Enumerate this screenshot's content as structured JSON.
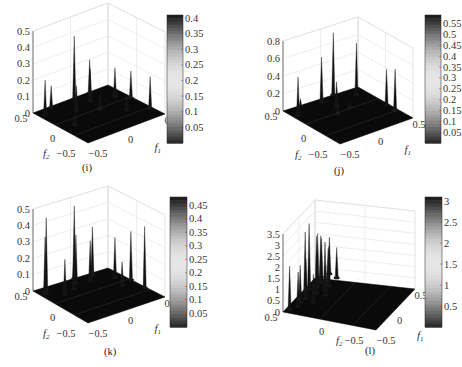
{
  "figure": {
    "panels": [
      "i",
      "j",
      "k",
      "l"
    ]
  },
  "chart_data": [
    {
      "id": "i",
      "type": "surface3d",
      "caption": "(i)",
      "xlabel": "f1",
      "ylabel": "f2",
      "x_ticks": [
        "-0.5",
        "0",
        "0.5"
      ],
      "y_ticks": [
        "-0.5",
        "0",
        "0.5"
      ],
      "z_ticks": [
        "0",
        "0.1",
        "0.2",
        "0.3",
        "0.4",
        "0.5"
      ],
      "zlim": [
        0,
        0.5
      ],
      "colorbar": {
        "ticks": [
          "0.05",
          "0.1",
          "0.15",
          "0.2",
          "0.25",
          "0.3",
          "0.35",
          "0.4"
        ],
        "range": [
          0,
          0.41
        ],
        "colormap": "gray-symmetric"
      },
      "grid": true,
      "peaks": [
        {
          "f1": -0.45,
          "f2": 0.35,
          "z": 0.22
        },
        {
          "f1": -0.3,
          "f2": 0.45,
          "z": 0.14
        },
        {
          "f1": -0.15,
          "f2": 0.2,
          "z": 0.16
        },
        {
          "f1": 0.0,
          "f2": 0.45,
          "z": 0.39
        },
        {
          "f1": 0.1,
          "f2": 0.3,
          "z": 0.2
        },
        {
          "f1": 0.2,
          "f2": 0.45,
          "z": 0.21
        },
        {
          "f1": 0.35,
          "f2": 0.2,
          "z": 0.18
        },
        {
          "f1": 0.45,
          "f2": 0.05,
          "z": 0.17
        },
        {
          "f1": 0.45,
          "f2": -0.3,
          "z": 0.2
        },
        {
          "f1": 0.05,
          "f2": 0.05,
          "z": 0.1
        },
        {
          "f1": -0.35,
          "f2": -0.05,
          "z": 0.07
        },
        {
          "f1": 0.25,
          "f2": -0.15,
          "z": 0.1
        }
      ]
    },
    {
      "id": "j",
      "type": "surface3d",
      "caption": "(j)",
      "xlabel": "f1",
      "ylabel": "f2",
      "x_ticks": [
        "-0.5",
        "0",
        "0.5"
      ],
      "y_ticks": [
        "-0.5",
        "0",
        "0.5"
      ],
      "z_ticks": [
        "0",
        "0.2",
        "0.4",
        "0.6",
        "0.8"
      ],
      "zlim": [
        0,
        0.8
      ],
      "colorbar": {
        "ticks": [
          "0.05",
          "0.1",
          "0.15",
          "0.2",
          "0.25",
          "0.3",
          "0.35",
          "0.4",
          "0.45",
          "0.5",
          "0.55"
        ],
        "range": [
          0,
          0.59
        ],
        "colormap": "gray-symmetric"
      },
      "grid": true,
      "peaks": [
        {
          "f1": -0.45,
          "f2": 0.3,
          "z": 0.45
        },
        {
          "f1": -0.3,
          "f2": 0.45,
          "z": 0.1
        },
        {
          "f1": -0.05,
          "f2": 0.4,
          "z": 0.52
        },
        {
          "f1": 0.0,
          "f2": 0.2,
          "z": 0.3
        },
        {
          "f1": 0.15,
          "f2": 0.45,
          "z": 0.72
        },
        {
          "f1": 0.35,
          "f2": 0.3,
          "z": 0.6
        },
        {
          "f1": 0.45,
          "f2": -0.1,
          "z": 0.42
        },
        {
          "f1": 0.45,
          "f2": -0.25,
          "z": 0.48
        },
        {
          "f1": -0.1,
          "f2": 0.05,
          "z": 0.12
        },
        {
          "f1": 0.1,
          "f2": 0.1,
          "z": 0.08
        }
      ]
    },
    {
      "id": "k",
      "type": "surface3d",
      "caption": "(k)",
      "xlabel": "f1",
      "ylabel": "f2",
      "x_ticks": [
        "-0.5",
        "0",
        "0.5"
      ],
      "y_ticks": [
        "-0.5",
        "0",
        "0.5"
      ],
      "z_ticks": [
        "0",
        "0.1",
        "0.2",
        "0.3",
        "0.4",
        "0.5"
      ],
      "zlim": [
        0,
        0.5
      ],
      "colorbar": {
        "ticks": [
          "0.05",
          "0.1",
          "0.15",
          "0.2",
          "0.25",
          "0.3",
          "0.35",
          "0.4",
          "0.45"
        ],
        "range": [
          0,
          0.48
        ],
        "colormap": "gray-symmetric"
      },
      "grid": true,
      "peaks": [
        {
          "f1": -0.45,
          "f2": 0.35,
          "z": 0.35
        },
        {
          "f1": -0.4,
          "f2": 0.4,
          "z": 0.45
        },
        {
          "f1": -0.3,
          "f2": 0.2,
          "z": 0.22
        },
        {
          "f1": -0.15,
          "f2": 0.25,
          "z": 0.2
        },
        {
          "f1": -0.05,
          "f2": 0.35,
          "z": 0.3
        },
        {
          "f1": 0.0,
          "f2": 0.45,
          "z": 0.45
        },
        {
          "f1": 0.1,
          "f2": 0.3,
          "z": 0.25
        },
        {
          "f1": 0.2,
          "f2": 0.4,
          "z": 0.3
        },
        {
          "f1": 0.35,
          "f2": 0.2,
          "z": 0.25
        },
        {
          "f1": 0.45,
          "f2": 0.05,
          "z": 0.3
        },
        {
          "f1": 0.45,
          "f2": -0.2,
          "z": 0.38
        },
        {
          "f1": 0.3,
          "f2": 0.0,
          "z": 0.15
        }
      ]
    },
    {
      "id": "l",
      "type": "surface3d",
      "caption": "(l)",
      "xlabel": "f1",
      "ylabel": "f2",
      "x_ticks": [
        "-0.5",
        "0",
        "0.5"
      ],
      "y_ticks": [
        "-0.5",
        "0",
        "0.5"
      ],
      "z_ticks": [
        "0",
        "0.5",
        "1",
        "1.5",
        "2",
        "2.5",
        "3",
        "3.5"
      ],
      "zlim": [
        0,
        3.5
      ],
      "colorbar": {
        "ticks": [
          "0.5",
          "1",
          "1.5",
          "2",
          "2.5",
          "3"
        ],
        "range": [
          0,
          3.1
        ],
        "colormap": "gray-symmetric"
      },
      "grid": true,
      "peaks": [
        {
          "f1": -0.45,
          "f2": 0.45,
          "z": 2.0
        },
        {
          "f1": -0.35,
          "f2": 0.4,
          "z": 1.6
        },
        {
          "f1": -0.25,
          "f2": 0.42,
          "z": 1.7
        },
        {
          "f1": -0.15,
          "f2": 0.4,
          "z": 1.8
        },
        {
          "f1": -0.05,
          "f2": 0.45,
          "z": 2.8
        },
        {
          "f1": 0.0,
          "f2": 0.35,
          "z": 2.6
        },
        {
          "f1": 0.05,
          "f2": 0.45,
          "z": 3.0
        },
        {
          "f1": 0.1,
          "f2": 0.3,
          "z": 2.2
        },
        {
          "f1": 0.15,
          "f2": 0.4,
          "z": 2.4
        },
        {
          "f1": 0.2,
          "f2": 0.3,
          "z": 1.8
        },
        {
          "f1": 0.25,
          "f2": 0.4,
          "z": 2.0
        },
        {
          "f1": 0.3,
          "f2": 0.35,
          "z": 1.5
        },
        {
          "f1": 0.35,
          "f2": 0.45,
          "z": 1.9
        },
        {
          "f1": 0.4,
          "f2": 0.3,
          "z": 1.4
        },
        {
          "f1": 0.45,
          "f2": 0.4,
          "z": 1.7
        },
        {
          "f1": -0.2,
          "f2": 0.3,
          "z": 1.3
        },
        {
          "f1": 0.0,
          "f2": 0.25,
          "z": 1.4
        }
      ]
    }
  ],
  "layout": {
    "i": {
      "ox": 0,
      "oy": 0,
      "L": [
        33,
        113
      ],
      "F": [
        88,
        143
      ],
      "R": [
        165,
        114
      ],
      "B": [
        108,
        85
      ],
      "zpx": 82,
      "cbar": [
        167,
        15,
        16,
        128
      ],
      "capY": 169,
      "zlabelX": 28
    },
    "j": {
      "ox": 0,
      "oy": 0,
      "L": [
        283,
        111
      ],
      "F": [
        340,
        144
      ],
      "R": [
        413,
        118
      ],
      "B": [
        358,
        87
      ],
      "zpx": 70,
      "cbar": [
        425,
        15,
        16,
        128
      ],
      "capY": 173,
      "zlabelX": 278
    },
    "k": {
      "ox": 0,
      "oy": 0,
      "L": [
        33,
        291
      ],
      "F": [
        88,
        323
      ],
      "R": [
        165,
        297
      ],
      "B": [
        108,
        268
      ],
      "zpx": 82,
      "cbar": [
        170,
        197,
        17,
        130
      ],
      "capY": 355,
      "zlabelX": 28
    },
    "l": {
      "ox": 0,
      "oy": 0,
      "L": [
        283,
        312
      ],
      "F": [
        376,
        330
      ],
      "R": [
        415,
        289
      ],
      "B": [
        315,
        278
      ],
      "zpx": 78,
      "cbar": [
        425,
        197,
        17,
        130
      ],
      "capY": 353,
      "zlabelX": 280
    }
  }
}
